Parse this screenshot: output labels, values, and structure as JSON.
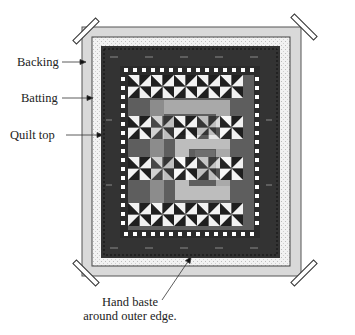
{
  "diagram": {
    "labels": {
      "backing": "Backing",
      "batting": "Batting",
      "quilt_top": "Quilt top",
      "baste_line1": "Hand baste",
      "baste_line2": "around outer edge."
    },
    "layers": [
      {
        "name": "backing",
        "color": "#d9d9d9"
      },
      {
        "name": "batting",
        "color": "#f3f3f3"
      },
      {
        "name": "quilt-top-border",
        "color": "#333333"
      }
    ],
    "quilt_colors": {
      "dark": "#2b2b2b",
      "medium": "#6e6e6e",
      "light": "#a9a9a9",
      "white": "#ffffff",
      "black": "#1a1a1a"
    },
    "clips": [
      "top-left",
      "top-right",
      "bottom-left",
      "bottom-right"
    ]
  }
}
